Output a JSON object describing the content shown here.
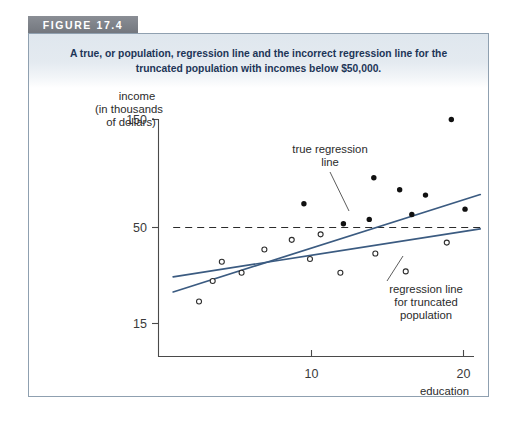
{
  "figure": {
    "banner_label": "FIGURE 17.4",
    "caption_line1": "A true, or population, regression line and the incorrect regression line for the",
    "caption_line2": "truncated population with incomes below $50,000.",
    "frame_color": "#8fa0b0",
    "banner_color": "#7a7e85",
    "caption_bg_color": "#e4eaf0",
    "caption_text_color": "#1d3557"
  },
  "chart_data": {
    "type": "scatter",
    "title": "A true, or population, regression line and the incorrect regression line for the truncated population with incomes below $50,000.",
    "xlabel_line1": "education",
    "xlabel_line2": "(in years)",
    "ylabel_line1": "income",
    "ylabel_line2": "(in thousands",
    "ylabel_line3": "of dollars)",
    "xlim": [
      0,
      22.5
    ],
    "ylim": [
      0,
      168
    ],
    "xticks": [
      10,
      20
    ],
    "xticklabels": [
      "10",
      "20"
    ],
    "yticks": [
      15,
      50,
      150
    ],
    "yticklabels": [
      "15",
      "50",
      "150"
    ],
    "grid": false,
    "legend": "none",
    "threshold": {
      "value": 50,
      "label": "$50,000 truncation threshold",
      "style": "dashed",
      "x_start": 0.9,
      "x_end": 21.1
    },
    "series": [
      {
        "name": "truncated population (income below 50)",
        "marker": "open-circle",
        "color": "#2d2d2d",
        "points": [
          {
            "x": 2.6,
            "y": 23.0
          },
          {
            "x": 3.5,
            "y": 30.5
          },
          {
            "x": 4.1,
            "y": 37.5
          },
          {
            "x": 5.4,
            "y": 33.5
          },
          {
            "x": 6.9,
            "y": 42.0
          },
          {
            "x": 8.7,
            "y": 45.5
          },
          {
            "x": 9.9,
            "y": 38.5
          },
          {
            "x": 10.6,
            "y": 47.5
          },
          {
            "x": 11.9,
            "y": 33.5
          },
          {
            "x": 14.2,
            "y": 40.5
          },
          {
            "x": 16.2,
            "y": 34.0
          },
          {
            "x": 18.9,
            "y": 44.5
          }
        ]
      },
      {
        "name": "population above truncation (income above 50)",
        "marker": "filled-circle",
        "color": "#111111",
        "points": [
          {
            "x": 9.5,
            "y": 72.0
          },
          {
            "x": 12.1,
            "y": 53.5
          },
          {
            "x": 13.8,
            "y": 57.5
          },
          {
            "x": 14.1,
            "y": 96.0
          },
          {
            "x": 15.8,
            "y": 85.0
          },
          {
            "x": 16.6,
            "y": 62.0
          },
          {
            "x": 17.5,
            "y": 80.0
          },
          {
            "x": 19.2,
            "y": 150.0
          },
          {
            "x": 20.1,
            "y": 67.0
          }
        ]
      }
    ],
    "lines": [
      {
        "name": "true regression line",
        "color": "#3b5b81",
        "x_start": 0.9,
        "y_start": 26.5,
        "x_end": 21.1,
        "y_end": 80.5,
        "annotation_line1": "true regression",
        "annotation_line2": "line"
      },
      {
        "name": "regression line for truncated population",
        "color": "#3b5b81",
        "x_start": 0.9,
        "y_start": 32.0,
        "x_end": 21.1,
        "y_end": 49.5,
        "annotation_line1": "regression line",
        "annotation_line2": "for truncated",
        "annotation_line3": "population"
      }
    ]
  }
}
